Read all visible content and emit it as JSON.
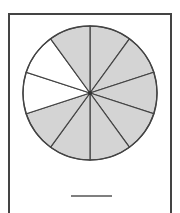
{
  "figure": {
    "total_parts": 10,
    "shaded_parts": 8,
    "unshaded_part_indices": [
      7,
      8
    ],
    "colors": {
      "shaded": "#d4d4d4",
      "unshaded": "#ffffff",
      "stroke": "#444444",
      "frame": "#444444"
    },
    "answer_blank": ""
  }
}
